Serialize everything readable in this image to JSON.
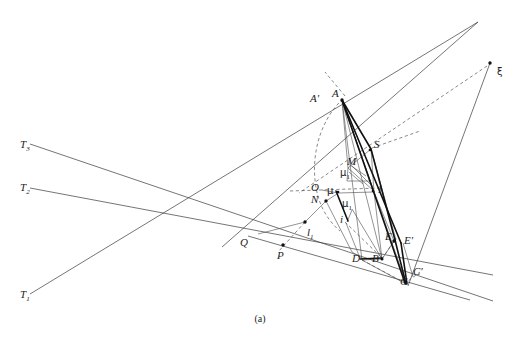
{
  "figure": {
    "caption": "(a)",
    "width": 520,
    "height": 342,
    "background": "#ffffff",
    "stroke_color": "#3a3a3a",
    "bold_stroke_color": "#111111",
    "label_color": "#222222"
  },
  "labels": [
    {
      "id": "T3",
      "text": "T",
      "sub": "3",
      "x": 20,
      "y": 139,
      "kind": "point-label"
    },
    {
      "id": "T2",
      "text": "T",
      "sub": "2",
      "x": 20,
      "y": 182,
      "kind": "point-label"
    },
    {
      "id": "T1",
      "text": "T",
      "sub": "1",
      "x": 20,
      "y": 289,
      "kind": "point-label"
    },
    {
      "id": "xi",
      "text": "ξ",
      "sub": "",
      "x": 497,
      "y": 67,
      "kind": "greek-point-label"
    },
    {
      "id": "Aprime",
      "text": "A′",
      "sub": "",
      "x": 310,
      "y": 93,
      "kind": "point-label"
    },
    {
      "id": "A",
      "text": "A",
      "sub": "",
      "x": 332,
      "y": 88,
      "kind": "point-label"
    },
    {
      "id": "S",
      "text": "S",
      "sub": "",
      "x": 374,
      "y": 139,
      "kind": "point-label"
    },
    {
      "id": "M",
      "text": "M",
      "sub": "",
      "x": 347,
      "y": 156,
      "kind": "point-label"
    },
    {
      "id": "mu1_upper",
      "text": "μ",
      "sub": "1",
      "x": 340,
      "y": 168,
      "kind": "greek-point-label"
    },
    {
      "id": "O",
      "text": "O",
      "sub": "",
      "x": 311,
      "y": 182,
      "kind": "point-label"
    },
    {
      "id": "mu",
      "text": "μ",
      "sub": "",
      "x": 327,
      "y": 186,
      "kind": "greek-point-label"
    },
    {
      "id": "N",
      "text": "N",
      "sub": "",
      "x": 311,
      "y": 194,
      "kind": "point-label"
    },
    {
      "id": "mu1_lower",
      "text": "μ",
      "sub": "1",
      "x": 342,
      "y": 199,
      "kind": "greek-point-label"
    },
    {
      "id": "I",
      "text": "I",
      "sub": "",
      "x": 378,
      "y": 184,
      "kind": "point-label"
    },
    {
      "id": "i",
      "text": "i",
      "sub": "",
      "x": 340,
      "y": 214,
      "kind": "point-label"
    },
    {
      "id": "l1",
      "text": "l",
      "sub": "1",
      "x": 307,
      "y": 227,
      "kind": "point-label"
    },
    {
      "id": "Q",
      "text": "Q",
      "sub": "",
      "x": 240,
      "y": 237,
      "kind": "point-label"
    },
    {
      "id": "P",
      "text": "P",
      "sub": "",
      "x": 277,
      "y": 250,
      "kind": "point-label"
    },
    {
      "id": "E",
      "text": "E",
      "sub": "",
      "x": 385,
      "y": 231,
      "kind": "point-label"
    },
    {
      "id": "Eprime",
      "text": "E′",
      "sub": "",
      "x": 404,
      "y": 235,
      "kind": "point-label"
    },
    {
      "id": "D",
      "text": "D",
      "sub": "",
      "x": 352,
      "y": 253,
      "kind": "point-label"
    },
    {
      "id": "B",
      "text": "B",
      "sub": "",
      "x": 372,
      "y": 253,
      "kind": "point-label"
    },
    {
      "id": "C",
      "text": "C",
      "sub": "",
      "x": 400,
      "y": 276,
      "kind": "point-label"
    },
    {
      "id": "Cprime",
      "text": "C′",
      "sub": "",
      "x": 413,
      "y": 266,
      "kind": "point-label"
    }
  ],
  "geometry": {
    "points": {
      "A": [
        342,
        100
      ],
      "Aprime": [
        327,
        103
      ],
      "S": [
        371,
        149
      ],
      "M": [
        348,
        168
      ],
      "mu1_upper": [
        347,
        180
      ],
      "mu": [
        337,
        194
      ],
      "N": [
        324,
        199
      ],
      "O": [
        322,
        190
      ],
      "mu1_lower": [
        352,
        209
      ],
      "I": [
        374,
        192
      ],
      "i": [
        346,
        224
      ],
      "l1": [
        303,
        224
      ],
      "Q": [
        258,
        233
      ],
      "P": [
        281,
        243
      ],
      "E": [
        393,
        240
      ],
      "Eprime": [
        403,
        243
      ],
      "D": [
        362,
        260
      ],
      "B": [
        382,
        259
      ],
      "C": [
        406,
        283
      ],
      "Cprime": [
        413,
        276
      ],
      "xi": [
        490,
        63
      ]
    },
    "dots": [
      {
        "name": "dot-A",
        "x": 342,
        "y": 100
      },
      {
        "name": "dot-xi",
        "x": 490,
        "y": 63
      },
      {
        "name": "dot-N",
        "x": 326,
        "y": 201
      },
      {
        "name": "dot-P",
        "x": 283,
        "y": 245
      },
      {
        "name": "dot-l1",
        "x": 305,
        "y": 222
      },
      {
        "name": "dot-E",
        "x": 394,
        "y": 241
      },
      {
        "name": "dot-B",
        "x": 382,
        "y": 259
      },
      {
        "name": "dot-I",
        "x": 372,
        "y": 191
      },
      {
        "name": "dot-mu",
        "x": 338,
        "y": 192
      },
      {
        "name": "dot-S",
        "x": 370,
        "y": 150
      }
    ]
  },
  "line_groups": {
    "tangent_lines": [
      {
        "name": "line-T3",
        "from": [
          30,
          144
        ],
        "to": [
          493,
          301
        ]
      },
      {
        "name": "line-T2",
        "from": [
          30,
          188
        ],
        "to": [
          493,
          275
        ]
      },
      {
        "name": "line-T1",
        "from": [
          30,
          294
        ],
        "to": [
          478,
          22
        ]
      }
    ],
    "xi_rays": [
      {
        "name": "ray-xi-to-C",
        "from": [
          490,
          63
        ],
        "to": [
          408,
          285
        ]
      },
      {
        "name": "ray-xi-dashed-to-O",
        "from": [
          490,
          63
        ],
        "to": [
          300,
          195
        ]
      }
    ]
  }
}
